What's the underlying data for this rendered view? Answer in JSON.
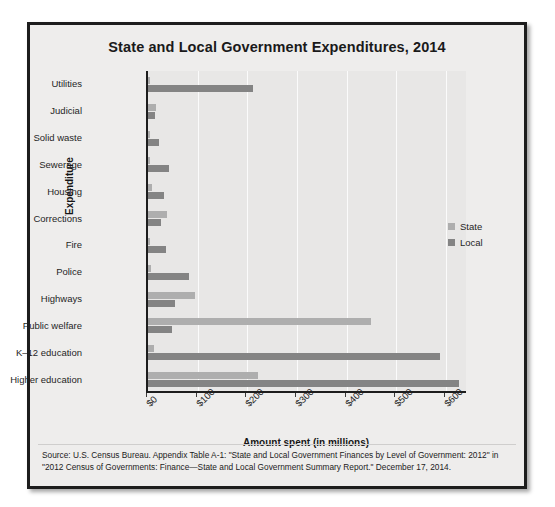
{
  "figure": {
    "title": "State and Local Government Expenditures, 2014",
    "source_note": "Source: U.S. Census Bureau. Appendix Table A-1: \"State and Local Government Finances by Level of Government: 2012\" in \"2012 Census of Governments: Finance—State and Local Government Summary Report.\" December 17, 2014."
  },
  "legend": {
    "position": "right",
    "entries": [
      {
        "label": "State",
        "color": "#aeaeae",
        "swatch_name": "legend-swatch-state"
      },
      {
        "label": "Local",
        "color": "#848484",
        "swatch_name": "legend-swatch-local"
      }
    ]
  },
  "chart_data": {
    "type": "bar",
    "orientation": "horizontal",
    "title": "State and Local Government Expenditures, 2014",
    "xlabel": "Amount spent (in millions)",
    "ylabel": "Expenditure",
    "xlim": [
      0,
      600
    ],
    "xticks": [
      0,
      100,
      200,
      300,
      400,
      500,
      600
    ],
    "xtick_labels": [
      "$0",
      "$100",
      "$200",
      "$300",
      "$400",
      "$500",
      "$600"
    ],
    "grid": true,
    "categories": [
      "Utilities",
      "Judicial",
      "Solid waste",
      "Sewerage",
      "Housing",
      "Corrections",
      "Fire",
      "Police",
      "Highways",
      "Public welfare",
      "K–12 education",
      "Higher education"
    ],
    "series": [
      {
        "name": "State",
        "color": "#aeaeae",
        "values": [
          5,
          16,
          2,
          2,
          8,
          38,
          1,
          7,
          95,
          449,
          12,
          222
        ]
      },
      {
        "name": "Local",
        "color": "#848484",
        "values": [
          212,
          15,
          22,
          42,
          32,
          26,
          36,
          82,
          54,
          48,
          588,
          626
        ]
      }
    ]
  }
}
